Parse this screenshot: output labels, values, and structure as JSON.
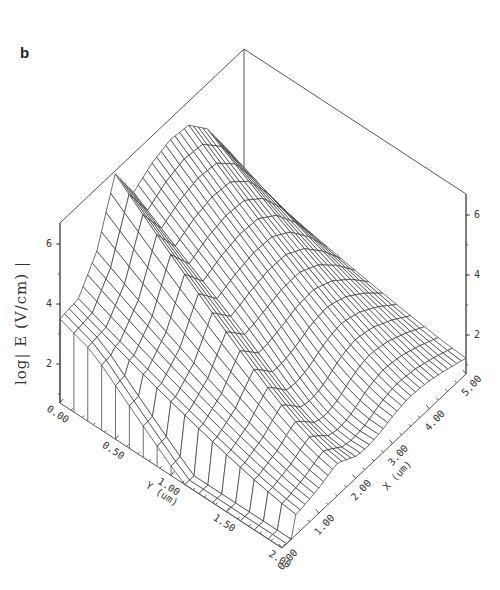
{
  "panel_label": "b",
  "chart_data": {
    "type": "surface3d",
    "title": "",
    "panel": "b",
    "xlabel": "X (um)",
    "ylabel": "Y (um)",
    "zlabel": "log| E (V/cm) |",
    "x_ticks": [
      "0.00",
      "1.00",
      "2.00",
      "3.00",
      "4.00",
      "5.00"
    ],
    "y_ticks": [
      "0.00",
      "0.50",
      "1.00",
      "1.50",
      "2.00"
    ],
    "z_ticks_left": [
      "2",
      "4",
      "6"
    ],
    "z_ticks_right": [
      "2",
      "4",
      "6"
    ],
    "xlim": [
      0,
      5
    ],
    "ylim": [
      0,
      2
    ],
    "zlim": [
      0.7,
      6.7
    ],
    "grid": false,
    "surface_description": "Wireframe surface of log|E| over (x,y); high ridge (~5-6) along y≈0-0.3, sharp peak (~6.6) near x≈1.5,y≈0.1, plateau ~3.5 near x≈0, falling to ~1 toward large y",
    "series": [
      {
        "name": "ridge_profile_along_x_at_y0",
        "x": [
          0.0,
          0.5,
          1.0,
          1.5,
          2.0,
          2.5,
          3.0,
          3.5,
          4.0,
          4.5,
          5.0
        ],
        "values": [
          3.5,
          3.6,
          4.6,
          6.6,
          5.4,
          5.8,
          6.0,
          5.9,
          5.2,
          4.0,
          2.5
        ]
      },
      {
        "name": "profile_along_y_at_x2.5",
        "y": [
          0.0,
          0.25,
          0.5,
          0.75,
          1.0,
          1.25,
          1.5,
          1.75,
          2.0
        ],
        "values": [
          5.8,
          5.3,
          4.7,
          4.1,
          3.4,
          2.6,
          1.8,
          1.2,
          1.0
        ]
      }
    ]
  }
}
